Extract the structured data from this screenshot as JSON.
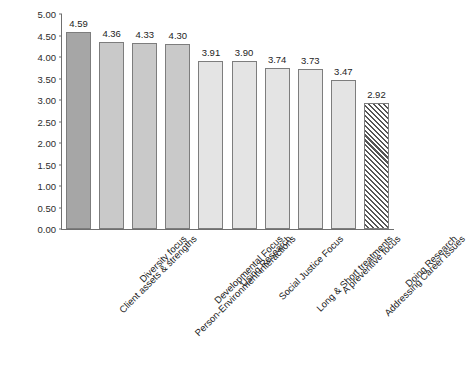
{
  "chart_data": {
    "type": "bar",
    "title": "",
    "subtitle": "",
    "xlabel": "",
    "ylabel": "",
    "ylim": [
      0,
      5.0
    ],
    "yticks": [
      "0.00",
      "0.50",
      "1.00",
      "1.50",
      "2.00",
      "2.50",
      "3.00",
      "3.50",
      "4.00",
      "4.50",
      "5.00"
    ],
    "ytick_values": [
      0,
      0.5,
      1.0,
      1.5,
      2.0,
      2.5,
      3.0,
      3.5,
      4.0,
      4.5,
      5.0
    ],
    "grid": false,
    "legend": "none",
    "categories": [
      "Client assets & strengths",
      "Diversity focus",
      "Person-Environment interactions",
      "Developmental Focus",
      "Using Research",
      "Social Justice Focus",
      "Long & Short treatments",
      "A preventive focus",
      "Addressing Career Issues",
      "Doing Research"
    ],
    "values": [
      4.59,
      4.36,
      4.33,
      4.3,
      3.91,
      3.9,
      3.74,
      3.73,
      3.47,
      2.92
    ],
    "data_labels": [
      "4.59",
      "4.36",
      "4.33",
      "4.30",
      "3.91",
      "3.90",
      "3.74",
      "3.73",
      "3.47",
      "2.92"
    ],
    "bar_styles": [
      "solid-dark-gray",
      "solid-mid-gray",
      "solid-mid-gray",
      "solid-mid-gray",
      "solid-light-gray",
      "solid-light-gray",
      "solid-light-gray",
      "solid-light-gray",
      "solid-light-gray",
      "diagonal-hatch"
    ],
    "colors": {
      "bar_dark": "#a6a6a6",
      "bar_mid": "#c9c9c9",
      "bar_light": "#e4e4e4",
      "bar_hatch_bg": "#ffffff",
      "bar_hatch_line": "#555555",
      "bar_border": "#7d7d7d",
      "axis": "#6f6f6f",
      "text": "#1d1d1d",
      "background": "#ffffff"
    }
  }
}
